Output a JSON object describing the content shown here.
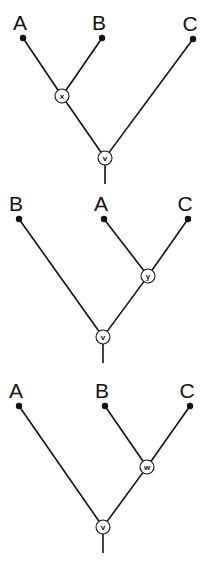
{
  "diagram": {
    "type": "phylogenetic-trees",
    "trees": [
      {
        "id": "tree-1",
        "leaves": [
          {
            "label": "A",
            "x": 23,
            "y": 38
          },
          {
            "label": "B",
            "x": 102,
            "y": 38
          },
          {
            "label": "C",
            "x": 193,
            "y": 39
          }
        ],
        "internal_nodes": [
          {
            "label": "x",
            "x": 62,
            "y": 96
          },
          {
            "label": "v",
            "x": 105,
            "y": 158
          }
        ],
        "edges": [
          [
            "A",
            "x"
          ],
          [
            "B",
            "x"
          ],
          [
            "x",
            "v"
          ],
          [
            "C",
            "v"
          ]
        ],
        "root_stem": {
          "x": 105,
          "y1": 165,
          "y2": 184
        }
      },
      {
        "id": "tree-2",
        "leaves": [
          {
            "label": "B",
            "x": 19,
            "y": 219
          },
          {
            "label": "A",
            "x": 104,
            "y": 219
          },
          {
            "label": "C",
            "x": 188,
            "y": 219
          }
        ],
        "internal_nodes": [
          {
            "label": "y",
            "x": 148,
            "y": 276
          },
          {
            "label": "v",
            "x": 103,
            "y": 337
          }
        ],
        "edges": [
          [
            "A",
            "y"
          ],
          [
            "C",
            "y"
          ],
          [
            "y",
            "v"
          ],
          [
            "B",
            "v"
          ]
        ],
        "root_stem": {
          "x": 103,
          "y1": 344,
          "y2": 363
        }
      },
      {
        "id": "tree-3",
        "leaves": [
          {
            "label": "A",
            "x": 19,
            "y": 406
          },
          {
            "label": "B",
            "x": 105,
            "y": 406
          },
          {
            "label": "C",
            "x": 190,
            "y": 406
          }
        ],
        "internal_nodes": [
          {
            "label": "w",
            "x": 147,
            "y": 467
          },
          {
            "label": "v",
            "x": 103,
            "y": 527
          }
        ],
        "edges": [
          [
            "B",
            "w"
          ],
          [
            "C",
            "w"
          ],
          [
            "w",
            "v"
          ],
          [
            "A",
            "v"
          ]
        ],
        "root_stem": {
          "x": 103,
          "y1": 534,
          "y2": 553
        }
      }
    ]
  }
}
